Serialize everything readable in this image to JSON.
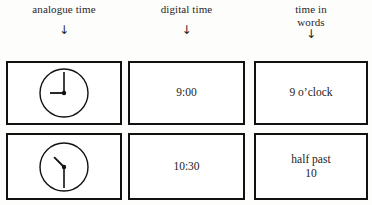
{
  "headers": [
    {
      "label": "analogue time",
      "arrow": "↓",
      "icon": "down-arrow-icon"
    },
    {
      "label": "digital time",
      "arrow": "↓",
      "icon": "down-arrow-icon"
    },
    {
      "label": "time in\nwords",
      "arrow": "↓",
      "icon": "down-arrow-icon"
    }
  ],
  "rows": [
    {
      "analogue": {
        "type": "analogue-clock",
        "hour": 9,
        "minute": 0,
        "hour_hand_angle_deg": 270,
        "minute_hand_angle_deg": 0,
        "has_tick_marks": false,
        "has_numerals": false
      },
      "digital": "9:00",
      "words": "9 o’clock"
    },
    {
      "analogue": {
        "type": "analogue-clock",
        "hour": 10,
        "minute": 30,
        "hour_hand_angle_deg": 315,
        "minute_hand_angle_deg": 180,
        "has_tick_marks": false,
        "has_numerals": false
      },
      "digital": "10:30",
      "words": "half past\n10"
    }
  ],
  "colors": {
    "page_background": "#fdfdfc",
    "cell_background": "#ffffff",
    "border": "#111111",
    "text": "#1b1b1b"
  }
}
